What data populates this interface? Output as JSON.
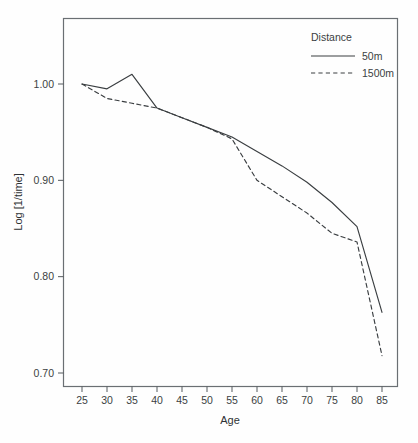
{
  "chart_data": {
    "type": "line",
    "title": "",
    "xlabel": "Age",
    "ylabel": "Log [1/time]",
    "xlim": [
      23,
      87
    ],
    "ylim": [
      0.685,
      1.042
    ],
    "grid": false,
    "legend_position": "top-right",
    "legend_title": "Distance",
    "x": [
      25,
      30,
      35,
      40,
      45,
      50,
      55,
      60,
      65,
      70,
      75,
      80,
      85
    ],
    "xticks": [
      "25",
      "30",
      "35",
      "40",
      "45",
      "50",
      "55",
      "60",
      "65",
      "70",
      "75",
      "80",
      "85"
    ],
    "yticks": [
      "1.00",
      "0.90",
      "0.80",
      "0.70"
    ],
    "ytick_values": [
      1.0,
      0.9,
      0.8,
      0.7
    ],
    "series": [
      {
        "name": "50m",
        "style": "solid",
        "color": "#3a3e41",
        "values": [
          1.0,
          0.995,
          1.01,
          0.975,
          0.965,
          0.955,
          0.945,
          0.93,
          0.915,
          0.898,
          0.877,
          0.852,
          0.763
        ]
      },
      {
        "name": "1500m",
        "style": "dashed",
        "color": "#3a3e41",
        "values": [
          1.0,
          0.985,
          0.98,
          0.975,
          0.965,
          0.955,
          0.943,
          0.9,
          0.883,
          0.866,
          0.845,
          0.836,
          0.718
        ]
      }
    ]
  },
  "axes": {
    "x_title": "Age",
    "y_title": "Log [1/time]"
  },
  "legend": {
    "title": "Distance",
    "entries": [
      {
        "label": "50m",
        "style": "solid"
      },
      {
        "label": "1500m",
        "style": "dashed"
      }
    ]
  },
  "style": {
    "background": "#fefefe",
    "line_color": "#3a3e41",
    "frame_color": "#6a6f73",
    "text_color": "#3b3f42"
  }
}
